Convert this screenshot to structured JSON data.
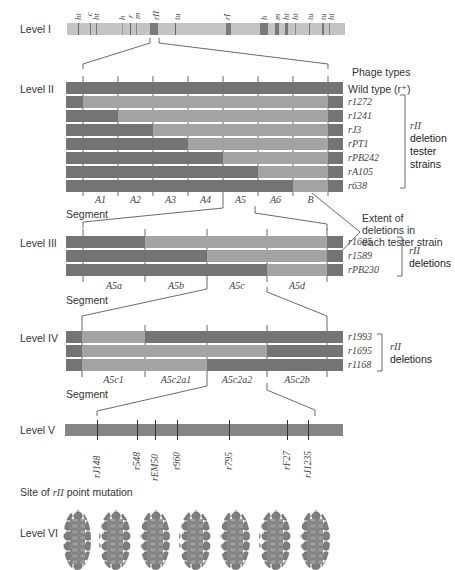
{
  "levels": {
    "I": "Level I",
    "II": "Level II",
    "III": "Level III",
    "IV": "Level IV",
    "V": "Level V",
    "VI": "Level VI"
  },
  "level1": {
    "gene_labels": [
      "ht",
      "c",
      "ht",
      "h",
      "r",
      "m",
      "rII",
      "tu",
      "rI",
      "h",
      "m",
      "ht",
      "ht",
      "tu",
      "tu",
      "ht"
    ]
  },
  "level2": {
    "header": "Phage types",
    "wild_type": "Wild type (r⁺)",
    "strains": [
      "r1272",
      "r1241",
      "rJ3",
      "rPT1",
      "rPB242",
      "rA105",
      "r638"
    ],
    "bracket_label": [
      "rII",
      "deletion",
      "tester",
      "strains"
    ],
    "segments": [
      "A1",
      "A2",
      "A3",
      "A4",
      "A5",
      "A6",
      "B"
    ],
    "segment_title": "Segment"
  },
  "annotation": {
    "extent": [
      "Extent of",
      "deletions in",
      "each tester strain"
    ]
  },
  "level3": {
    "strains": [
      "r1605",
      "r1589",
      "rPB230"
    ],
    "bracket_label": [
      "rII",
      "deletions"
    ],
    "segments": [
      "A5a",
      "A5b",
      "A5c",
      "A5d"
    ],
    "segment_title": "Segment"
  },
  "level4": {
    "strains": [
      "r1993",
      "r1695",
      "r1168"
    ],
    "bracket_label": [
      "rII",
      "deletions"
    ],
    "segments": [
      "A5c1",
      "A5c2a1",
      "A5c2a2",
      "A5c2b"
    ],
    "segment_title": "Segment"
  },
  "level5": {
    "mutations": [
      "rJ148",
      "r548",
      "rEM50",
      "r960",
      "r795",
      "rF27",
      "rJ1235"
    ]
  },
  "level6": {
    "caption": "Site of rII point mutation",
    "caption_pre": "Site of ",
    "caption_ital": "rII",
    "caption_post": " point mutation"
  },
  "colors": {
    "dark": "#747474",
    "light": "#a3a3a3",
    "level1_bar": "#c4c4c4",
    "band": "#6f6f6f"
  }
}
